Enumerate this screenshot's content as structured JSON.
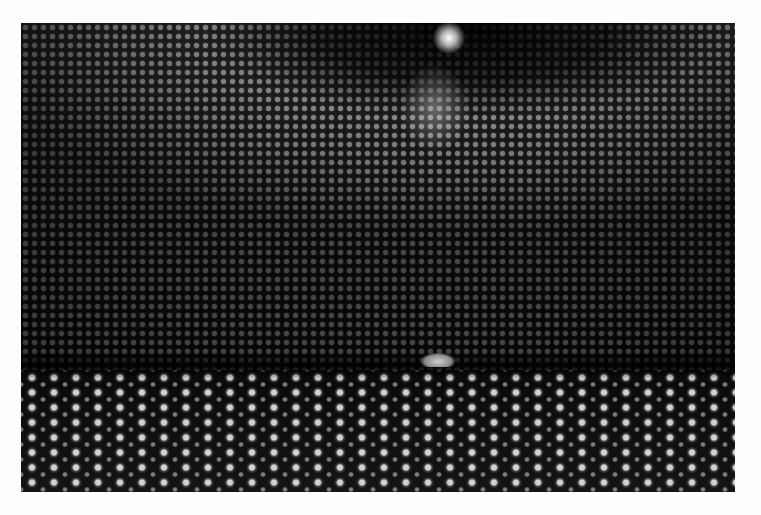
{
  "image": {
    "subject": "Interior of a large cylindrical detector tank lined with thousands of photomultiplier tubes, with a small raft in the center",
    "tones": "grayscale",
    "background_color": "#fdfdfd",
    "photo_base_color": "#0b0b0b"
  }
}
